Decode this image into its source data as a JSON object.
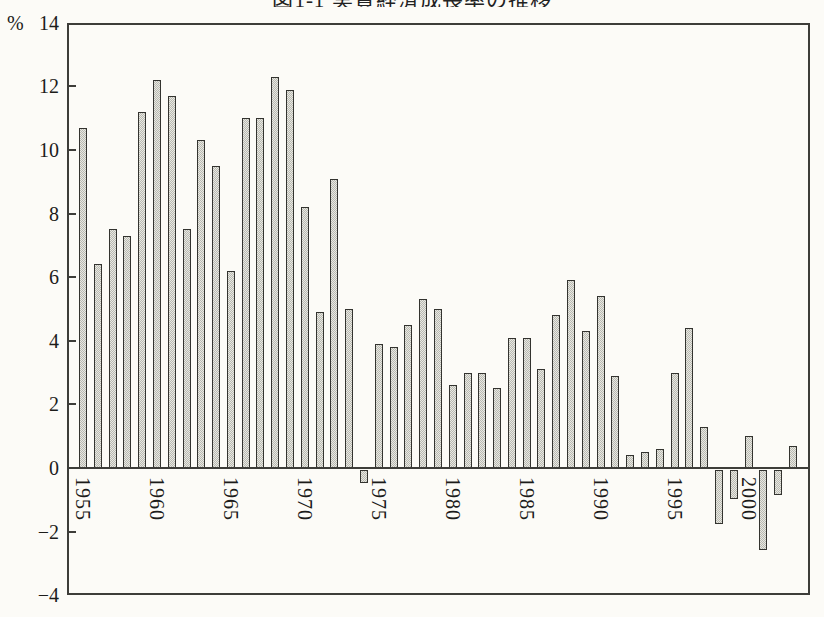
{
  "header": {
    "clipped_title": "図1-1 実質経済成長率の推移"
  },
  "y_axis": {
    "unit_label": "%",
    "tick_labels": [
      "14",
      "12",
      "10",
      "8",
      "6",
      "4",
      "2",
      "0",
      "−2",
      "−4"
    ],
    "tick_values": [
      14,
      12,
      10,
      8,
      6,
      4,
      2,
      0,
      -2,
      -4
    ],
    "tick_marks_at": [
      12,
      10,
      8,
      6,
      4,
      2,
      0,
      -2
    ]
  },
  "x_axis": {
    "tick_labels": [
      "1955",
      "1960",
      "1965",
      "1970",
      "1975",
      "1980",
      "1985",
      "1990",
      "1995",
      "2000"
    ]
  },
  "colors": {
    "background": "#fcfbf7",
    "axis": "#3d3d39",
    "bar_fill_light": "#e8e8e2",
    "bar_fill_dot": "#b9b9b1",
    "bar_border": "#33332f",
    "text": "#1c1c1a"
  },
  "chart_data": {
    "type": "bar",
    "title": "図1-1 実質経済成長率の推移",
    "xlabel": "",
    "ylabel": "%",
    "ylim": [
      -4,
      14
    ],
    "ytick_interval": 2,
    "grid": false,
    "legend": "none",
    "x_tick_label_style": "rotated-90-clockwise",
    "categories": [
      1955,
      1956,
      1957,
      1958,
      1959,
      1960,
      1961,
      1962,
      1963,
      1964,
      1965,
      1966,
      1967,
      1968,
      1969,
      1970,
      1971,
      1972,
      1973,
      1974,
      1975,
      1976,
      1977,
      1978,
      1979,
      1980,
      1981,
      1982,
      1983,
      1984,
      1985,
      1986,
      1987,
      1988,
      1989,
      1990,
      1991,
      1992,
      1993,
      1994,
      1995,
      1996,
      1997,
      1998,
      1999,
      2000,
      2001,
      2002,
      2003
    ],
    "values": [
      10.7,
      6.4,
      7.5,
      7.3,
      11.2,
      12.2,
      11.7,
      7.5,
      10.3,
      9.5,
      6.2,
      11.0,
      11.0,
      12.3,
      11.9,
      8.2,
      4.9,
      9.1,
      5.0,
      -0.4,
      3.9,
      3.8,
      4.5,
      5.3,
      5.0,
      2.6,
      3.0,
      3.0,
      2.5,
      4.1,
      4.1,
      3.1,
      4.8,
      5.9,
      4.3,
      5.4,
      2.9,
      0.4,
      0.5,
      0.6,
      3.0,
      4.4,
      1.3,
      -1.7,
      -0.9,
      1.0,
      -2.5,
      -0.8,
      0.7
    ]
  }
}
